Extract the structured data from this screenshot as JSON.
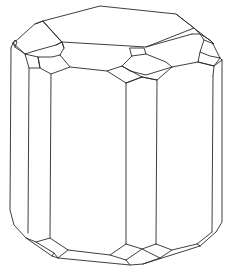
{
  "figure": {
    "stroke_color": "#2a2a2a",
    "background_color": "#ffffff",
    "labels": []
  }
}
